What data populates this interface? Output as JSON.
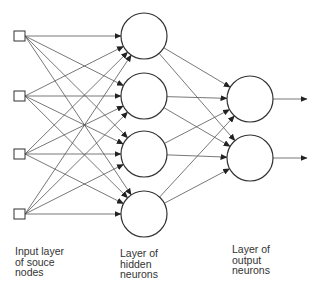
{
  "diagram": {
    "type": "feedforward-neural-network",
    "colors": {
      "stroke": "#333333",
      "edge": "#555555",
      "background": "#ffffff"
    },
    "input_nodes": [
      {
        "x": 19.5,
        "y": 36
      },
      {
        "x": 19.5,
        "y": 96
      },
      {
        "x": 19.5,
        "y": 154
      },
      {
        "x": 19.5,
        "y": 214
      }
    ],
    "hidden_nodes": [
      {
        "x": 144,
        "y": 36
      },
      {
        "x": 144,
        "y": 96
      },
      {
        "x": 144,
        "y": 154
      },
      {
        "x": 144,
        "y": 214
      }
    ],
    "output_nodes": [
      {
        "x": 250,
        "y": 99
      },
      {
        "x": 250,
        "y": 158
      }
    ],
    "node_radius": 23,
    "input_square_size": 11,
    "output_arrow_end_x": 307
  },
  "labels": {
    "input_layer": "Input layer\nof souce\nnodes",
    "hidden_layer": "Layer of\nhidden\nneurons",
    "output_layer": "Layer of\noutput\nneurons"
  }
}
